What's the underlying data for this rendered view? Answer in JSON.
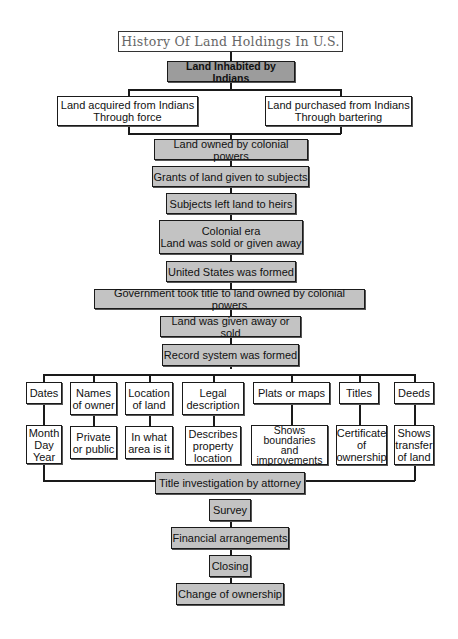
{
  "title": "History Of Land Holdings In U.S.",
  "colors": {
    "box_light": "#c3c3c3",
    "box_dark": "#9c9c9c",
    "border": "#1a1a1a",
    "background": "#ffffff"
  },
  "nodes": {
    "inhabited": "Land Inhabited by Indians",
    "force": "Land acquired from Indians\nThrough force",
    "bartering": "Land purchased from Indians\nThrough bartering",
    "colonial_powers": "Land owned by colonial powers",
    "grants": "Grants of land given to subjects",
    "heirs": "Subjects left land to heirs",
    "colonial_era": "Colonial era\nLand was sold or given away",
    "us_formed": "United States was formed",
    "gov_title": "Government took title to land owned by colonial powers",
    "given_sold": "Land was given away or sold",
    "record_system": "Record system was formed",
    "title_investigation": "Title investigation by attorney",
    "survey": "Survey",
    "financial": "Financial arrangements",
    "closing": "Closing",
    "change": "Change of ownership"
  },
  "records": [
    {
      "label": "Dates",
      "detail": "Month\nDay\nYear"
    },
    {
      "label": "Names\nof owner",
      "detail": "Private\nor public"
    },
    {
      "label": "Location\nof land",
      "detail": "In what\narea is it"
    },
    {
      "label": "Legal\ndescription",
      "detail": "Describes\nproperty\nlocation"
    },
    {
      "label": "Plats or maps",
      "detail": "Shows\nboundaries\nand\nimprovements"
    },
    {
      "label": "Titles",
      "detail": "Certificate\nof\nownership"
    },
    {
      "label": "Deeds",
      "detail": "Shows\ntransfer\nof land"
    }
  ]
}
